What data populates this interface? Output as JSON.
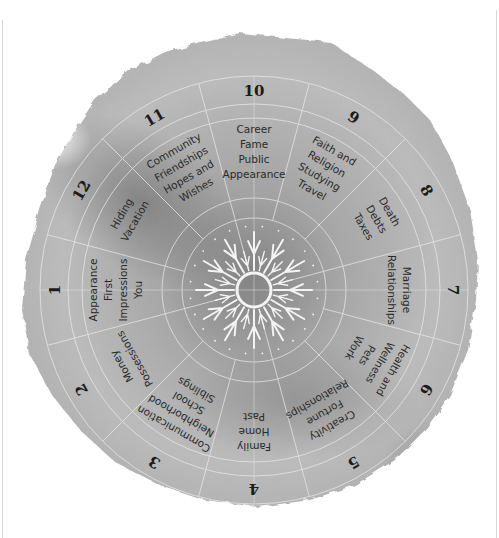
{
  "diagram": {
    "center": {
      "x": 254,
      "y": 290
    },
    "colors": {
      "paper_light": "#c9c9c9",
      "paper_mid": "#a9a9a9",
      "paper_dark": "#7d7d7d",
      "lines": "#e6e6e6",
      "text": "#2a2a2a",
      "sun": "#f2f2f2"
    },
    "center_symbol": "sun-icon",
    "houses": [
      {
        "number": "1",
        "keywords": [
          "Appearance",
          "First",
          "Impressions",
          "You"
        ]
      },
      {
        "number": "2",
        "keywords": [
          "Money",
          "Possessions"
        ]
      },
      {
        "number": "3",
        "keywords": [
          "Communication",
          "Neighborhood",
          "School",
          "Siblings"
        ]
      },
      {
        "number": "4",
        "keywords": [
          "Family",
          "Home",
          "Past"
        ]
      },
      {
        "number": "5",
        "keywords": [
          "Creativity",
          "Fortune",
          "Relationships"
        ]
      },
      {
        "number": "6",
        "keywords": [
          "Health and",
          "Wellness",
          "Pets",
          "Work"
        ]
      },
      {
        "number": "7",
        "keywords": [
          "Marriage",
          "Relationships"
        ]
      },
      {
        "number": "8",
        "keywords": [
          "Death",
          "Debts",
          "Taxes"
        ]
      },
      {
        "number": "9",
        "keywords": [
          "Faith and",
          "Religion",
          "Studying",
          "Travel"
        ]
      },
      {
        "number": "10",
        "keywords": [
          "Career",
          "Fame",
          "Public",
          "Appearance"
        ]
      },
      {
        "number": "11",
        "keywords": [
          "Community",
          "Friendships",
          "Hopes and",
          "Wishes"
        ]
      },
      {
        "number": "12",
        "keywords": [
          "Hiding",
          "Vacation"
        ]
      }
    ]
  }
}
